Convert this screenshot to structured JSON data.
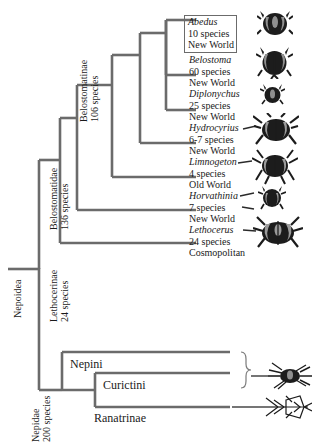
{
  "figure": {
    "type": "cladogram"
  },
  "clade_labels": [
    {
      "name": "belostomatinae",
      "lines": [
        "Belostomatinae",
        "106 species"
      ]
    },
    {
      "name": "belostomatidae",
      "lines": [
        "Belostomatidae",
        "136 species"
      ]
    },
    {
      "name": "lethocerinae",
      "lines": [
        "Lethocerinae",
        "24 species"
      ]
    },
    {
      "name": "nepoidea",
      "lines": [
        "Nepoidea"
      ]
    },
    {
      "name": "nepidae",
      "lines": [
        "Nepidae",
        "200 species"
      ]
    }
  ],
  "terminals": [
    {
      "genus": "Abedus",
      "species": "10 species",
      "distribution": "New World",
      "boxed": true
    },
    {
      "genus": "Belostoma",
      "species": "60 species",
      "distribution": "New World",
      "boxed": false
    },
    {
      "genus": "Diplonychus",
      "species": "25 species",
      "distribution": "New World",
      "boxed": false
    },
    {
      "genus": "Hydrocyrius",
      "species": "6-7 species",
      "distribution": "New World",
      "boxed": false
    },
    {
      "genus": "Limnogeton",
      "species": "4 species",
      "distribution": "Old World",
      "boxed": false
    },
    {
      "genus": "Horvathinia",
      "species": "7 species",
      "distribution": "New World",
      "boxed": false
    },
    {
      "genus": "Lethocerus",
      "species": "24 species",
      "distribution": "Cosmopolitan",
      "boxed": false
    }
  ],
  "tribes": [
    {
      "name": "tribe-nepini",
      "label": "Nepini"
    },
    {
      "name": "tribe-curictini",
      "label": "Curictini"
    },
    {
      "name": "tribe-ranatrinae",
      "label": "Ranatrinae"
    }
  ],
  "illustrations": [
    {
      "name": "abedus-bug-icon"
    },
    {
      "name": "belostoma-bug-icon"
    },
    {
      "name": "diplonychus-bug-icon"
    },
    {
      "name": "hydrocyrius-bug-icon"
    },
    {
      "name": "limnogeton-bug-icon"
    },
    {
      "name": "horvathinia-bug-icon"
    },
    {
      "name": "lethocerus-bug-icon"
    },
    {
      "name": "nepa-water-scorpion-icon"
    },
    {
      "name": "ranatra-water-scorpion-icon"
    }
  ],
  "colors": {
    "branch": "#6b6b6b",
    "text": "#1a1a1a",
    "background": "#ffffff",
    "bug_dark": "#1c1c1c",
    "bug_mid": "#8a8a8a"
  }
}
